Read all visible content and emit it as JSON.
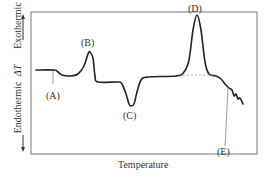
{
  "chart_data": {
    "type": "line",
    "title": "",
    "xlabel": "Temperature",
    "ylabel": "ΔT",
    "y_direction_labels": {
      "up": "Exothermic",
      "down": "Endothermic"
    },
    "grid": false,
    "legend": null,
    "annotations": [
      {
        "label": "(A)",
        "meaning": "baseline shift (glass transition)",
        "x_rel": 0.08
      },
      {
        "label": "(B)",
        "meaning": "exothermic peak",
        "x_rel": 0.26
      },
      {
        "label": "(C)",
        "meaning": "endothermic dip",
        "x_rel": 0.45
      },
      {
        "label": "(D)",
        "meaning": "large exothermic peak with dashed baseline",
        "x_rel": 0.74
      },
      {
        "label": "(E)",
        "meaning": "decomposition / irregular decline",
        "x_rel": 0.9
      }
    ],
    "series": [
      {
        "name": "DTA curve",
        "points_px": [
          [
            36,
            70
          ],
          [
            54,
            70
          ],
          [
            58,
            72
          ],
          [
            62,
            75
          ],
          [
            70,
            76
          ],
          [
            78,
            74
          ],
          [
            84,
            66
          ],
          [
            88,
            54
          ],
          [
            90,
            52
          ],
          [
            93,
            58
          ],
          [
            95,
            76
          ],
          [
            98,
            82
          ],
          [
            118,
            82
          ],
          [
            122,
            84
          ],
          [
            126,
            94
          ],
          [
            129,
            104
          ],
          [
            131,
            106
          ],
          [
            134,
            104
          ],
          [
            137,
            92
          ],
          [
            141,
            80
          ],
          [
            148,
            77
          ],
          [
            176,
            76
          ],
          [
            184,
            72
          ],
          [
            189,
            60
          ],
          [
            193,
            30
          ],
          [
            197,
            15
          ],
          [
            201,
            30
          ],
          [
            205,
            62
          ],
          [
            209,
            74
          ],
          [
            216,
            76
          ],
          [
            221,
            79
          ],
          [
            225,
            84
          ],
          [
            229,
            88
          ],
          [
            232,
            90
          ],
          [
            234,
            96
          ],
          [
            236,
            94
          ],
          [
            238,
            99
          ],
          [
            240,
            98
          ],
          [
            243,
            104
          ]
        ]
      }
    ],
    "dashed_baseline_px": [
      [
        183,
        75
      ],
      [
        218,
        75
      ]
    ]
  },
  "labels": {
    "A": "(A)",
    "B": "(B)",
    "C": "(C)",
    "D": "(D)",
    "E": "(E)",
    "exothermic": "Exothermic",
    "endothermic": "Endothermic",
    "delta_t": "ΔT",
    "temperature": "Temperature"
  }
}
